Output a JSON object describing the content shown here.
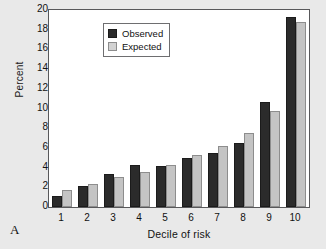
{
  "figure": {
    "panel_label": "A",
    "background_color": "#e9e9e9",
    "plot_background_color": "#ffffff",
    "axis_color": "#58585a"
  },
  "legend": {
    "position": "top-left-inside",
    "entries": [
      {
        "label": "Observed",
        "color": "#2b2b2b"
      },
      {
        "label": "Expected",
        "color": "#c4c4c4"
      }
    ]
  },
  "chart_data": {
    "type": "bar",
    "title": "",
    "subtitle": "",
    "xlabel": "Decile of risk",
    "ylabel": "Percent",
    "categories": [
      "1",
      "2",
      "3",
      "4",
      "5",
      "6",
      "7",
      "8",
      "9",
      "10"
    ],
    "series": [
      {
        "name": "Observed",
        "color": "#2b2b2b",
        "values": [
          1.1,
          2.15,
          3.4,
          4.25,
          4.15,
          5.0,
          5.45,
          6.45,
          10.65,
          19.3
        ]
      },
      {
        "name": "Expected",
        "color": "#c4c4c4",
        "values": [
          1.7,
          2.35,
          3.0,
          3.6,
          4.25,
          5.25,
          6.2,
          7.5,
          9.75,
          18.8
        ]
      }
    ],
    "ylim": [
      0,
      20
    ],
    "yticks": [
      0,
      2,
      4,
      6,
      8,
      10,
      12,
      14,
      16,
      18,
      20
    ],
    "ytick_labels": [
      "0",
      "2",
      "4",
      "6",
      "8",
      "10",
      "12",
      "14",
      "16",
      "18",
      "20"
    ],
    "xtick_labels": [
      "1",
      "2",
      "3",
      "4",
      "5",
      "6",
      "7",
      "8",
      "9",
      "10"
    ],
    "grid": false,
    "legend_position": "upper left"
  }
}
